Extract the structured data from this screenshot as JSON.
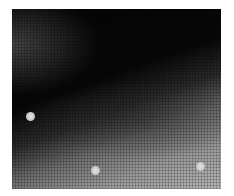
{
  "image": {
    "description": "Grayscale halftone photograph: dark upper region transitioning to light gray lower region along a diagonal boundary, with three small light circular spots",
    "colors": {
      "dark": "#050505",
      "light": "#b4b4b4",
      "spot": "#d8d8d8"
    },
    "spots": [
      {
        "x": 30,
        "y": 116
      },
      {
        "x": 95,
        "y": 170
      },
      {
        "x": 200,
        "y": 166
      }
    ]
  }
}
